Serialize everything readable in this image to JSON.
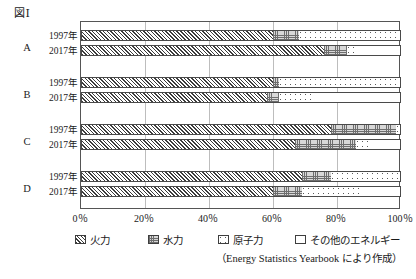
{
  "figure": {
    "label": "図Ⅰ",
    "source_note": "（Energy Statistics Yearbook により作成）"
  },
  "legend": {
    "items": [
      {
        "key": "thermal",
        "label": "火力",
        "pattern": "diagonal-hatch"
      },
      {
        "key": "hydro",
        "label": "水力",
        "pattern": "cross-grid"
      },
      {
        "key": "nuclear",
        "label": "原子力",
        "pattern": "dotted"
      },
      {
        "key": "other",
        "label": "その他のエネルギー",
        "pattern": "blank"
      }
    ]
  },
  "axis": {
    "ticks": [
      "0％",
      "20％",
      "40％",
      "60％",
      "80％",
      "100％"
    ],
    "tick_values": [
      0,
      20,
      40,
      60,
      80,
      100
    ],
    "min": 0,
    "max": 100
  },
  "groups": [
    {
      "letter": "A",
      "rows": [
        {
          "year": "1997年"
        },
        {
          "year": "2017年"
        }
      ]
    },
    {
      "letter": "B",
      "rows": [
        {
          "year": "1997年"
        },
        {
          "year": "2017年"
        }
      ]
    },
    {
      "letter": "C",
      "rows": [
        {
          "year": "1997年"
        },
        {
          "year": "2017年"
        }
      ]
    },
    {
      "letter": "D",
      "rows": [
        {
          "year": "1997年"
        },
        {
          "year": "2017年"
        }
      ]
    }
  ],
  "chart_data": {
    "type": "bar",
    "orientation": "horizontal",
    "stacked": true,
    "normalized": true,
    "title": "図Ⅰ",
    "xlabel": "",
    "ylabel": "",
    "xlim": [
      0,
      100
    ],
    "grid": true,
    "legend_position": "bottom",
    "categories": [
      "A 1997年",
      "A 2017年",
      "B 1997年",
      "B 2017年",
      "C 1997年",
      "C 2017年",
      "D 1997年",
      "D 2017年"
    ],
    "series": [
      {
        "name": "火力",
        "values": [
          60,
          76,
          60,
          58,
          78,
          67,
          69,
          60
        ]
      },
      {
        "name": "水力",
        "values": [
          8,
          7,
          2,
          4,
          20.5,
          19,
          9,
          9
        ]
      },
      {
        "name": "原子力",
        "values": [
          32,
          3,
          38,
          10.5,
          1,
          5,
          22,
          18
        ]
      },
      {
        "name": "その他のエネルギー",
        "values": [
          0,
          14,
          0,
          27.5,
          0.5,
          9,
          0,
          13
        ]
      }
    ]
  }
}
